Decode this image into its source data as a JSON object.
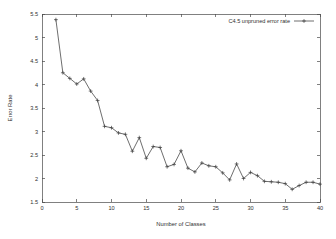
{
  "chart_data": {
    "type": "line",
    "title": "",
    "xlabel": "Number of Classes",
    "ylabel": "Error Rate",
    "xlim": [
      0,
      40
    ],
    "ylim": [
      1.5,
      5.5
    ],
    "xticks": [
      0,
      5,
      10,
      15,
      20,
      25,
      30,
      35,
      40
    ],
    "xtick_labels": [
      "0",
      "5",
      "10",
      "15",
      "20",
      "25",
      "30",
      "35",
      "40"
    ],
    "yticks": [
      1.5,
      2,
      2.5,
      3,
      3.5,
      4,
      4.5,
      5,
      5.5
    ],
    "ytick_labels": [
      "1.5",
      "2",
      "2.5",
      "3",
      "3.5",
      "4",
      "4.5",
      "5",
      "5.5"
    ],
    "grid": false,
    "legend_position": "top-right",
    "marker": "cross",
    "line_color": "#3d3d3d",
    "series": [
      {
        "name": "C4.5 unpruned error rate",
        "x": [
          2,
          3,
          4,
          5,
          6,
          7,
          8,
          9,
          10,
          11,
          12,
          13,
          14,
          15,
          16,
          17,
          18,
          19,
          20,
          21,
          22,
          23,
          24,
          25,
          26,
          27,
          28,
          29,
          30,
          31,
          32,
          33,
          34,
          35,
          36,
          37,
          38,
          39,
          40
        ],
        "values": [
          5.38,
          4.25,
          4.13,
          4.01,
          4.12,
          3.86,
          3.66,
          3.11,
          3.08,
          2.97,
          2.94,
          2.58,
          2.87,
          2.43,
          2.68,
          2.66,
          2.25,
          2.3,
          2.59,
          2.22,
          2.14,
          2.33,
          2.27,
          2.25,
          2.12,
          1.97,
          2.31,
          2.0,
          2.13,
          2.06,
          1.94,
          1.93,
          1.92,
          1.89,
          1.77,
          1.85,
          1.92,
          1.92,
          1.88
        ]
      }
    ]
  },
  "legend": {
    "entries": [
      {
        "label": "C4.5 unpruned error rate",
        "sample": "line-with-cross-marker"
      }
    ]
  },
  "axes": {
    "x_title": "Number of Classes",
    "y_title": "Error Rate"
  }
}
